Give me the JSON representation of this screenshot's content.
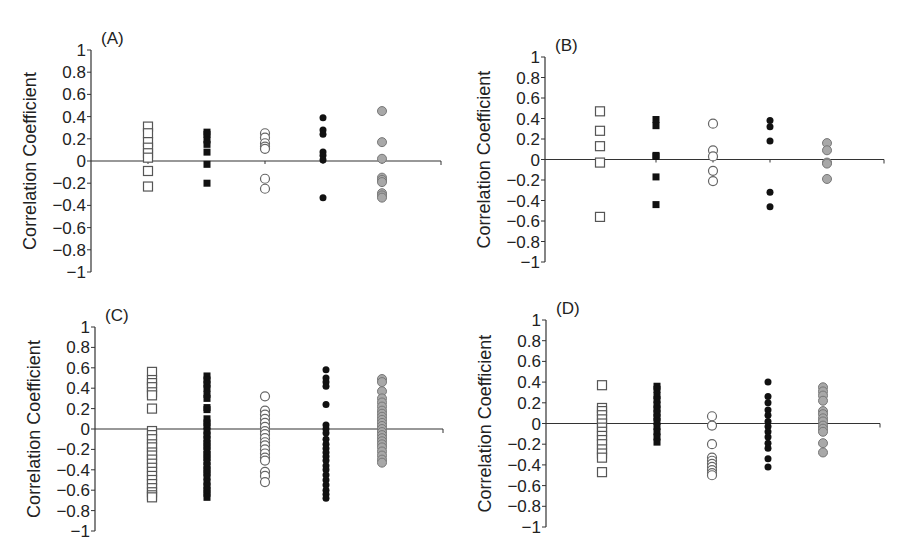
{
  "figure": {
    "width": 904,
    "height": 560,
    "colors": {
      "axis": "#333333",
      "open_square_stroke": "#555555",
      "filled_square": "#111111",
      "open_circle_stroke": "#666666",
      "filled_circle": "#111111",
      "gray_circle_fill": "#a8a8a8",
      "gray_circle_stroke": "#777777"
    },
    "series_markers": [
      "open-square",
      "filled-square",
      "open-circle",
      "filled-circle",
      "gray-circle"
    ]
  },
  "chart_data": [
    {
      "panel": "(A)",
      "type": "scatter",
      "ylabel": "Correlation Coefficient",
      "xlabel": "",
      "ylim": [
        -1,
        1
      ],
      "yticks": [
        "1",
        "0.8",
        "0.6",
        "0.4",
        "0.2",
        "0",
        "-0.2",
        "-0.4",
        "-0.6",
        "-0.8",
        "-1"
      ],
      "layout": {
        "axis_x": 91,
        "x_end": 441,
        "y_top": 50,
        "y_bottom": 272,
        "columns_x": [
          148,
          207,
          265,
          323,
          382
        ]
      },
      "series": [
        {
          "marker": "open-square",
          "values": [
            0.31,
            0.25,
            0.17,
            0.12,
            0.07,
            0.03,
            -0.09,
            -0.23
          ]
        },
        {
          "marker": "filled-square",
          "values": [
            0.26,
            0.24,
            0.19,
            0.15,
            0.08,
            -0.03,
            -0.2
          ]
        },
        {
          "marker": "open-circle",
          "values": [
            0.25,
            0.21,
            0.16,
            0.13,
            0.11,
            -0.16,
            -0.25
          ]
        },
        {
          "marker": "filled-circle",
          "values": [
            0.39,
            0.28,
            0.24,
            0.08,
            0.05,
            0.01,
            -0.33
          ]
        },
        {
          "marker": "gray-circle",
          "values": [
            0.45,
            0.17,
            0.02,
            -0.15,
            -0.17,
            -0.19,
            -0.29,
            -0.31,
            -0.33
          ]
        }
      ]
    },
    {
      "panel": "(B)",
      "type": "scatter",
      "ylabel": "Correlation Coefficient",
      "xlabel": "",
      "ylim": [
        -1,
        1
      ],
      "yticks": [
        "1",
        "0.8",
        "0.6",
        "0.4",
        "0.2",
        "0",
        "-0.2",
        "-0.4",
        "-0.6",
        "-0.8",
        "-1"
      ],
      "layout": {
        "axis_x": 545,
        "x_end": 884,
        "y_top": 57,
        "y_bottom": 262,
        "columns_x": [
          600,
          656,
          713,
          770,
          827
        ]
      },
      "series": [
        {
          "marker": "open-square",
          "values": [
            0.47,
            0.28,
            0.13,
            -0.03,
            -0.56
          ]
        },
        {
          "marker": "filled-square",
          "values": [
            0.39,
            0.33,
            0.04,
            0.03,
            -0.17,
            -0.44
          ]
        },
        {
          "marker": "open-circle",
          "values": [
            0.35,
            0.09,
            0.03,
            -0.11,
            -0.21
          ]
        },
        {
          "marker": "filled-circle",
          "values": [
            0.38,
            0.32,
            0.18,
            -0.32,
            -0.46
          ]
        },
        {
          "marker": "gray-circle",
          "values": [
            0.16,
            0.09,
            -0.03,
            -0.04,
            -0.19
          ]
        }
      ]
    },
    {
      "panel": "(C)",
      "type": "scatter",
      "ylabel": "Correlation Coefficient",
      "xlabel": "",
      "ylim": [
        -1,
        1
      ],
      "yticks": [
        "1",
        "0.8",
        "0.6",
        "0.4",
        "0.2",
        "0",
        "-0.2",
        "-0.4",
        "-0.6",
        "-0.8",
        "-1"
      ],
      "layout": {
        "axis_x": 95,
        "x_end": 443,
        "y_top": 327,
        "y_bottom": 531,
        "columns_x": [
          152,
          207,
          265,
          326,
          382
        ]
      },
      "series": [
        {
          "marker": "open-square",
          "values": [
            0.56,
            0.48,
            0.45,
            0.41,
            0.36,
            0.33,
            0.2,
            -0.02,
            -0.06,
            -0.1,
            -0.15,
            -0.18,
            -0.23,
            -0.26,
            -0.3,
            -0.34,
            -0.38,
            -0.42,
            -0.46,
            -0.5,
            -0.54,
            -0.58,
            -0.62,
            -0.65,
            -0.67
          ]
        },
        {
          "marker": "filled-square",
          "values": [
            0.52,
            0.48,
            0.44,
            0.4,
            0.34,
            0.3,
            0.21,
            0.19,
            0.1,
            0.06,
            0.03,
            -0.02,
            -0.06,
            -0.1,
            -0.14,
            -0.17,
            -0.21,
            -0.25,
            -0.28,
            -0.32,
            -0.36,
            -0.4,
            -0.43,
            -0.47,
            -0.52,
            -0.56,
            -0.6,
            -0.63,
            -0.67
          ]
        },
        {
          "marker": "open-circle",
          "values": [
            0.32,
            0.18,
            0.14,
            0.1,
            0.06,
            0.02,
            -0.02,
            -0.05,
            -0.09,
            -0.13,
            -0.16,
            -0.2,
            -0.24,
            -0.28,
            -0.31,
            -0.42,
            -0.46,
            -0.52
          ]
        },
        {
          "marker": "filled-circle",
          "values": [
            0.58,
            0.5,
            0.46,
            0.42,
            0.24,
            0.04,
            0.0,
            -0.04,
            -0.1,
            -0.15,
            -0.19,
            -0.23,
            -0.27,
            -0.31,
            -0.36,
            -0.4,
            -0.45,
            -0.5,
            -0.55,
            -0.6,
            -0.64,
            -0.68
          ]
        },
        {
          "marker": "gray-circle",
          "values": [
            0.49,
            0.46,
            0.37,
            0.3,
            0.26,
            0.22,
            0.18,
            0.15,
            0.12,
            0.09,
            0.06,
            0.03,
            0.0,
            -0.03,
            -0.06,
            -0.09,
            -0.12,
            -0.15,
            -0.18,
            -0.22,
            -0.26,
            -0.3,
            -0.33
          ]
        }
      ]
    },
    {
      "panel": "(D)",
      "type": "scatter",
      "ylabel": "Correlation Coefficient",
      "xlabel": "",
      "ylim": [
        -1,
        1
      ],
      "yticks": [
        "1",
        "0.8",
        "0.6",
        "0.4",
        "0.2",
        "0",
        "-0.2",
        "-0.4",
        "-0.6",
        "-0.8",
        "-1"
      ],
      "layout": {
        "axis_x": 546,
        "x_end": 880,
        "y_top": 320,
        "y_bottom": 527,
        "columns_x": [
          602,
          657,
          712,
          768,
          823
        ]
      },
      "series": [
        {
          "marker": "open-square",
          "values": [
            0.37,
            0.15,
            0.12,
            0.08,
            0.04,
            0.0,
            -0.04,
            -0.08,
            -0.12,
            -0.16,
            -0.2,
            -0.25,
            -0.29,
            -0.33,
            -0.47
          ]
        },
        {
          "marker": "filled-square",
          "values": [
            0.36,
            0.33,
            0.27,
            0.23,
            0.18,
            0.14,
            0.1,
            0.06,
            0.02,
            -0.03,
            -0.08,
            -0.13,
            -0.18
          ]
        },
        {
          "marker": "open-circle",
          "values": [
            0.07,
            -0.02,
            -0.2,
            -0.33,
            -0.36,
            -0.39,
            -0.42,
            -0.45,
            -0.48,
            -0.5
          ]
        },
        {
          "marker": "filled-circle",
          "values": [
            0.4,
            0.26,
            0.2,
            0.13,
            0.08,
            0.02,
            -0.03,
            -0.08,
            -0.13,
            -0.19,
            -0.24,
            -0.34,
            -0.42
          ]
        },
        {
          "marker": "gray-circle",
          "values": [
            0.35,
            0.31,
            0.27,
            0.22,
            0.12,
            0.09,
            0.05,
            0.02,
            -0.02,
            -0.05,
            -0.08,
            -0.19,
            -0.28
          ]
        }
      ]
    }
  ]
}
